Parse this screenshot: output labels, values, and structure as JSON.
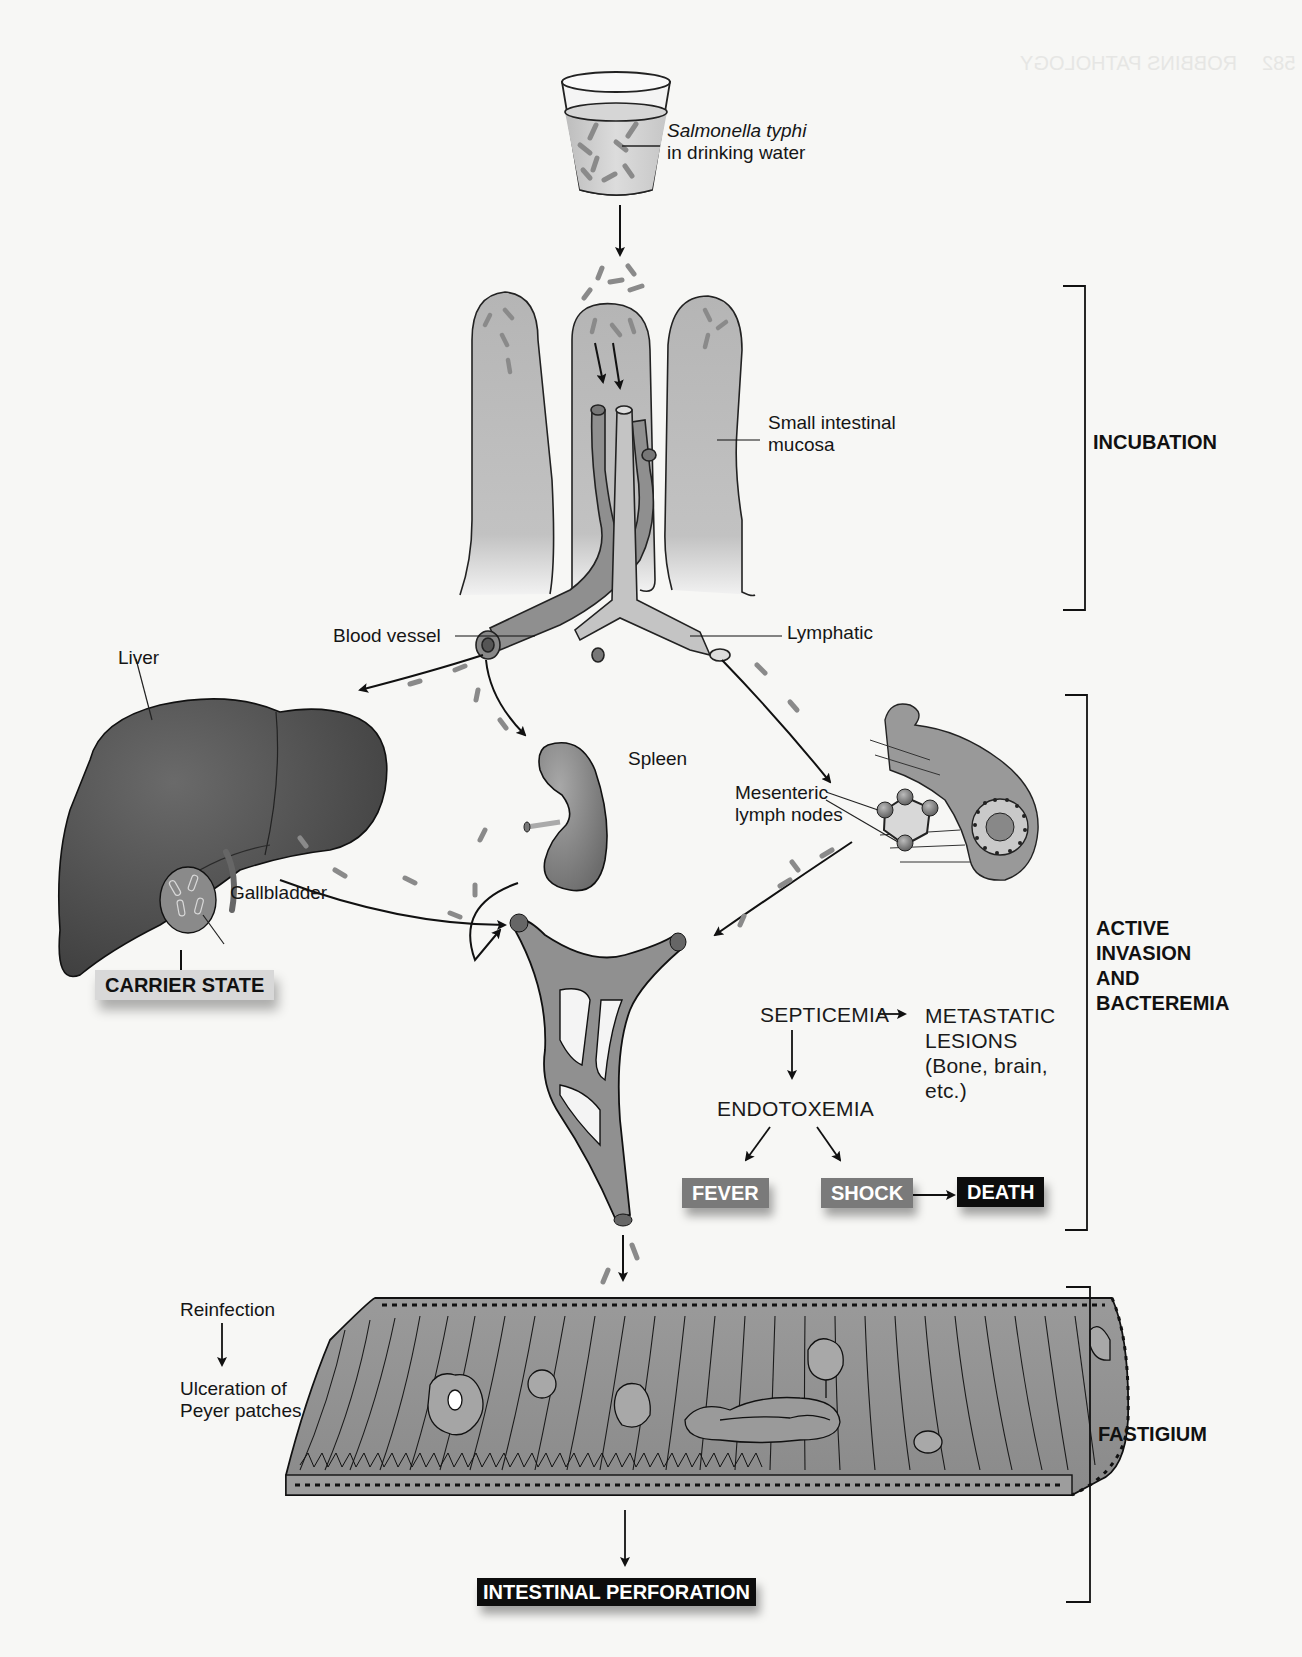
{
  "diagram": {
    "source_label": "Salmonella typhi in drinking water",
    "source_label_lines": [
      "Salmonella typhi",
      "in drinking water"
    ],
    "anatomy_labels": {
      "small_intestinal_mucosa": [
        "Small intestinal",
        "mucosa"
      ],
      "blood_vessel": "Blood vessel",
      "lymphatic": "Lymphatic",
      "liver": "Liver",
      "spleen": "Spleen",
      "gallbladder": "Gallbladder",
      "mesenteric_lymph_nodes": [
        "Mesenteric",
        "lymph nodes"
      ]
    },
    "phases": [
      {
        "id": "incubation",
        "label": "INCUBATION"
      },
      {
        "id": "active",
        "label_lines": [
          "ACTIVE",
          "INVASION",
          "AND",
          "BACTEREMIA"
        ]
      },
      {
        "id": "fastigium",
        "label": "FASTIGIUM"
      }
    ],
    "flow": {
      "septicemia": "SEPTICEMIA",
      "metastatic_lines": [
        "METASTATIC",
        "LESIONS",
        "(Bone, brain,",
        "etc.)"
      ],
      "endotoxemia": "ENDOTOXEMIA",
      "fever": "FEVER",
      "shock": "SHOCK",
      "death": "DEATH"
    },
    "outcomes": {
      "carrier_state": "CARRIER STATE",
      "intestinal_perforation": "INTESTINAL PERFORATION"
    },
    "reinfection": {
      "reinfection": "Reinfection",
      "ulceration_lines": [
        "Ulceration of",
        "Peyer patches"
      ]
    },
    "colors": {
      "organ_dark": "#4a4a4a",
      "tissue_mid": "#8e8e8e",
      "tissue_light": "#b9b9b9",
      "box_gray": "#7a7a7a",
      "box_black": "#0d0d0d",
      "background": "#f7f7f5"
    }
  },
  "page_header_bleedthrough": {
    "page_number": "582",
    "running_title": "ROBBINS PATHOLOGY"
  }
}
